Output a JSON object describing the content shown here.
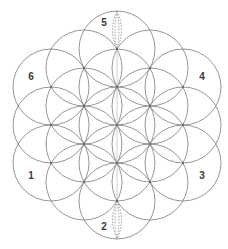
{
  "diagram": {
    "center": [
      117,
      125
    ],
    "radius": 38,
    "stroke_color": "#8a8a8a",
    "label_color": "#3a3a3a",
    "circles": [
      {
        "cx": 117,
        "cy": 125
      },
      {
        "cx": 117,
        "cy": 87
      },
      {
        "cx": 117,
        "cy": 163
      },
      {
        "cx": 84,
        "cy": 106
      },
      {
        "cx": 150,
        "cy": 106
      },
      {
        "cx": 84,
        "cy": 144
      },
      {
        "cx": 150,
        "cy": 144
      },
      {
        "cx": 117,
        "cy": 49
      },
      {
        "cx": 117,
        "cy": 201
      },
      {
        "cx": 51,
        "cy": 87
      },
      {
        "cx": 183,
        "cy": 87
      },
      {
        "cx": 51,
        "cy": 163
      },
      {
        "cx": 183,
        "cy": 163
      },
      {
        "cx": 51,
        "cy": 125
      },
      {
        "cx": 183,
        "cy": 125
      },
      {
        "cx": 84,
        "cy": 68
      },
      {
        "cx": 150,
        "cy": 68
      },
      {
        "cx": 84,
        "cy": 182
      },
      {
        "cx": 150,
        "cy": 182
      }
    ],
    "labels": [
      {
        "text": "5",
        "x": 104,
        "y": 23
      },
      {
        "text": "6",
        "x": 31,
        "y": 77
      },
      {
        "text": "4",
        "x": 202,
        "y": 77
      },
      {
        "text": "1",
        "x": 31,
        "y": 176
      },
      {
        "text": "3",
        "x": 202,
        "y": 176
      },
      {
        "text": "2",
        "x": 104,
        "y": 227
      }
    ],
    "dashed_lenses": [
      {
        "position": "top",
        "y_top": 11,
        "y_bottom": 49
      },
      {
        "position": "bottom",
        "y_top": 201,
        "y_bottom": 239
      }
    ]
  }
}
